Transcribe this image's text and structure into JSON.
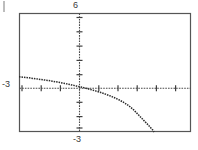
{
  "figure": {
    "type": "graphing-calculator-plot",
    "title": "",
    "border_color": "#555555",
    "axis_color": "#4a4a4a",
    "curve_color": "#2b2b2b",
    "background": "#ffffff"
  },
  "labels": {
    "y_max": "6",
    "y_min": "-3",
    "x_min": "-3"
  },
  "plot_box": {
    "left": 19,
    "top": 13,
    "right": 191,
    "bottom": 132
  },
  "axes": {
    "y_axis_x": 79,
    "x_axis_y": 88,
    "x_tick_spacing": 19.2,
    "y_tick_spacing": 14.3,
    "ticks_visible": true
  },
  "chart_data": {
    "type": "line",
    "title": "",
    "xlabel": "",
    "ylabel": "",
    "xlim": [
      -3,
      6
    ],
    "ylim": [
      -3,
      6
    ],
    "grid": false,
    "legend": null,
    "annotations": [
      {
        "text": "6",
        "position": "top-of-y-axis"
      },
      {
        "text": "-3",
        "position": "left-of-x-axis"
      },
      {
        "text": "-3",
        "position": "below-y-axis"
      }
    ],
    "series": [
      {
        "name": "curve",
        "style": "dotted",
        "x": [
          -3.0,
          -2.75,
          -2.5,
          -2.25,
          -2.0,
          -1.75,
          -1.5,
          -1.25,
          -1.0,
          -0.75,
          -0.5,
          -0.25,
          0.0,
          0.25,
          0.5,
          0.75,
          1.0,
          1.25,
          1.5,
          1.75,
          2.0,
          2.25,
          2.5,
          2.75,
          3.0,
          3.25,
          3.5,
          3.75,
          4.0,
          4.07
        ],
        "y": [
          1.18,
          1.14,
          1.1,
          1.05,
          1.0,
          0.95,
          0.9,
          0.84,
          0.78,
          0.71,
          0.64,
          0.56,
          0.48,
          0.4,
          0.31,
          0.21,
          0.11,
          0.0,
          -0.12,
          -0.26,
          -0.41,
          -0.58,
          -0.78,
          -1.02,
          -1.33,
          -1.7,
          -2.08,
          -2.45,
          -2.85,
          -3.0
        ]
      }
    ]
  }
}
